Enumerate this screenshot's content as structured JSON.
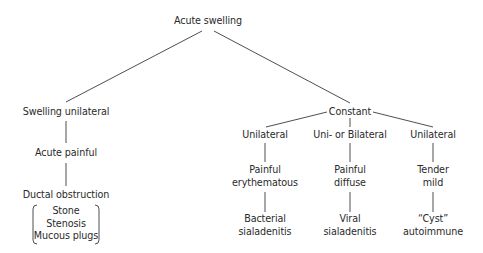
{
  "diagram": {
    "root": {
      "label": "Acute swelling"
    },
    "left_branch": {
      "level1": "Swelling unilateral",
      "level2": "Acute painful",
      "level3": "Ductal obstruction",
      "causes": [
        "Stone",
        "Stenosis",
        "Mucous plugs"
      ]
    },
    "right_branch": {
      "level1": "Constant",
      "columns": [
        {
          "laterality": "Unilateral",
          "symptom": [
            "Painful",
            "erythematous"
          ],
          "diagnosis": [
            "Bacterial",
            "sialadenitis"
          ]
        },
        {
          "laterality": "Uni- or Bilateral",
          "symptom": [
            "Painful",
            "diffuse"
          ],
          "diagnosis": [
            "Viral",
            "sialadenitis"
          ]
        },
        {
          "laterality": "Unilateral",
          "symptom": [
            "Tender",
            "mild"
          ],
          "diagnosis": [
            "“Cyst”",
            "autoimmune"
          ]
        }
      ]
    },
    "colors": {
      "line": "#3a3a3a",
      "text": "#2a2a2a",
      "background": "#ffffff"
    }
  }
}
